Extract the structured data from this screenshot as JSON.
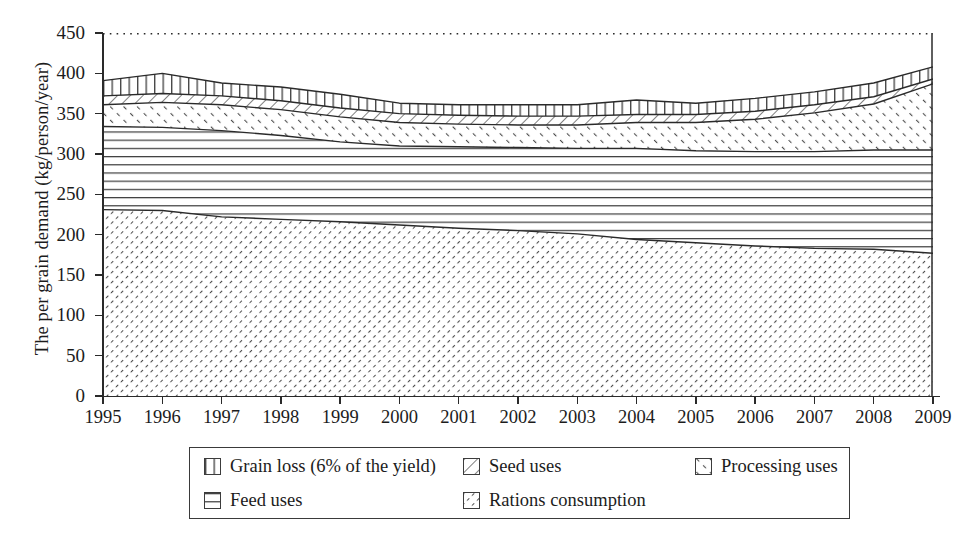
{
  "chart_data": {
    "type": "area",
    "stacked": true,
    "title": "",
    "subtitle": "",
    "xlabel": "",
    "ylabel": "The per grain demand (kg/person/year)",
    "x": [
      1995,
      1996,
      1997,
      1998,
      1999,
      2000,
      2001,
      2002,
      2003,
      2004,
      2005,
      2006,
      2007,
      2008,
      2009
    ],
    "xtick_labels": [
      "1995",
      "1996",
      "1997",
      "1998",
      "1999",
      "2000",
      "2001",
      "2002",
      "2003",
      "2004",
      "2005",
      "2006",
      "2007",
      "2008",
      "2009"
    ],
    "ytick_labels": [
      "0",
      "50",
      "100",
      "150",
      "200",
      "250",
      "300",
      "350",
      "400",
      "450"
    ],
    "yticks": [
      0,
      50,
      100,
      150,
      200,
      250,
      300,
      350,
      400,
      450
    ],
    "ylim": [
      0,
      450
    ],
    "xlim": [
      1995,
      2009
    ],
    "grid": false,
    "legend_position": "bottom",
    "stack_order_bottom_to_top": [
      "Rations consumption",
      "Feed uses",
      "Processing uses",
      "Seed uses",
      "Grain loss (6% of the yield)"
    ],
    "series": [
      {
        "name": "Rations consumption",
        "pattern": "dense-diagonal",
        "values": [
          231,
          230,
          222,
          219,
          216,
          212,
          208,
          205,
          201,
          194,
          190,
          186,
          183,
          182,
          177
        ]
      },
      {
        "name": "Feed uses",
        "pattern": "horizontal-lines",
        "values": [
          103,
          103,
          107,
          104,
          99,
          98,
          101,
          103,
          106,
          113,
          114,
          117,
          120,
          123,
          128
        ]
      },
      {
        "name": "Processing uses",
        "pattern": "sparse-back-diagonal",
        "values": [
          27,
          31,
          32,
          32,
          31,
          29,
          28,
          28,
          29,
          32,
          35,
          40,
          48,
          57,
          82
        ]
      },
      {
        "name": "Seed uses",
        "pattern": "wide-diagonal",
        "values": [
          11,
          11,
          11,
          11,
          11,
          11,
          11,
          11,
          11,
          10,
          10,
          10,
          10,
          9,
          6
        ]
      },
      {
        "name": "Grain loss (6% of the yield)",
        "pattern": "vertical-lines",
        "values": [
          19,
          25,
          16,
          17,
          17,
          13,
          13,
          14,
          14,
          18,
          14,
          16,
          16,
          17,
          15
        ]
      }
    ],
    "cumulative_tops": {
      "Rations consumption": [
        231,
        230,
        222,
        219,
        216,
        212,
        208,
        205,
        201,
        194,
        190,
        186,
        183,
        182,
        177
      ],
      "Feed uses": [
        334,
        333,
        329,
        323,
        315,
        310,
        309,
        308,
        307,
        307,
        304,
        303,
        303,
        305,
        305
      ],
      "Processing uses": [
        361,
        364,
        361,
        355,
        346,
        339,
        337,
        336,
        336,
        339,
        339,
        343,
        351,
        362,
        387
      ],
      "Seed uses": [
        372,
        375,
        372,
        366,
        357,
        350,
        348,
        347,
        347,
        349,
        349,
        353,
        361,
        371,
        393
      ],
      "Grain loss (6% of the yield)": [
        391,
        400,
        388,
        383,
        374,
        363,
        361,
        361,
        361,
        367,
        363,
        369,
        377,
        388,
        408
      ]
    }
  },
  "legend": {
    "items": [
      {
        "label": "Grain loss (6% of the yield)",
        "pattern": "vertical-lines",
        "row": 0,
        "col": 0
      },
      {
        "label": "Seed uses",
        "pattern": "wide-diagonal",
        "row": 0,
        "col": 1
      },
      {
        "label": "Processing uses",
        "pattern": "sparse-back-diagonal",
        "row": 0,
        "col": 2
      },
      {
        "label": "Feed uses",
        "pattern": "horizontal-lines",
        "row": 1,
        "col": 0
      },
      {
        "label": "Rations consumption",
        "pattern": "dense-diagonal",
        "row": 1,
        "col": 1
      }
    ]
  },
  "colors": {
    "line": "#2a2a2a",
    "text": "#1c1c1c",
    "background": "#ffffff",
    "pattern_stroke": "#555555"
  }
}
